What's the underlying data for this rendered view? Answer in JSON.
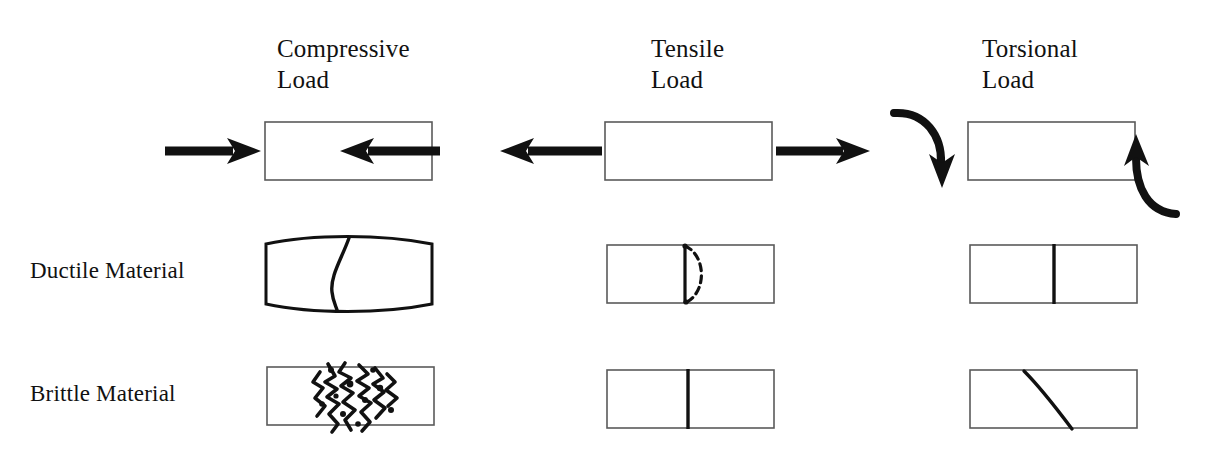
{
  "diagram": {
    "title_present": false,
    "column_headers": [
      {
        "id": "compressive",
        "label": "Compressive\nLoad"
      },
      {
        "id": "tensile",
        "label": "Tensile\nLoad"
      },
      {
        "id": "torsional",
        "label": "Torsional\nLoad"
      }
    ],
    "row_labels": [
      {
        "id": "load",
        "label": ""
      },
      {
        "id": "ductile",
        "label": "Ductile Material"
      },
      {
        "id": "brittle",
        "label": "Brittle Material"
      }
    ],
    "colors": {
      "ink": "#111111",
      "specimen_outline": "#555555",
      "background": "#ffffff"
    },
    "cells": [
      {
        "row": "load",
        "column": "compressive",
        "icon": "specimen-with-inward-arrows",
        "description": "Rectangular specimen with two straight arrows pointing inward from left and right"
      },
      {
        "row": "load",
        "column": "tensile",
        "icon": "specimen-with-outward-arrows",
        "description": "Rectangular specimen with two straight arrows pointing outward to left and right"
      },
      {
        "row": "load",
        "column": "torsional",
        "icon": "specimen-with-curved-arrows",
        "description": "Rectangular specimen with curved arrow bending downward on the left and upward on the right"
      },
      {
        "row": "ductile",
        "column": "compressive",
        "icon": "barreled-specimen-s-crack",
        "description": "Barrel-shaped bulged specimen with an S-shaped crack through the middle"
      },
      {
        "row": "ductile",
        "column": "tensile",
        "icon": "cup-and-cone-fracture",
        "description": "Specimen with solid vertical fracture line and dashed cup-shaped curve"
      },
      {
        "row": "ductile",
        "column": "torsional",
        "icon": "vertical-fracture",
        "description": "Specimen with a single clean vertical fracture line"
      },
      {
        "row": "brittle",
        "column": "compressive",
        "icon": "shattered-specimen",
        "description": "Specimen with a crushed, shattered fragmented zone in the middle"
      },
      {
        "row": "brittle",
        "column": "tensile",
        "icon": "vertical-fracture",
        "description": "Specimen with a single clean vertical fracture line"
      },
      {
        "row": "brittle",
        "column": "torsional",
        "icon": "diagonal-helical-fracture",
        "description": "Specimen with a diagonal fracture line running from top toward bottom right"
      }
    ]
  }
}
